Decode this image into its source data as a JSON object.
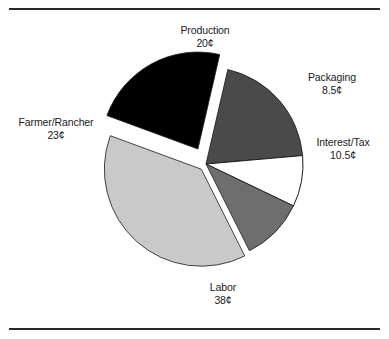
{
  "figure": {
    "top_rule": "horizontal-rule",
    "bottom_rule": "horizontal-rule"
  },
  "chart_data": {
    "type": "pie",
    "title": "",
    "subtitle": "",
    "xlabel": "",
    "ylabel": "",
    "legend_position": "none",
    "grid": false,
    "unit": "¢",
    "total": 100,
    "start_angle_deg": -77,
    "direction": "clockwise",
    "center": {
      "x": 206,
      "y": 164
    },
    "radius": 97,
    "slices": [
      {
        "label": "Production",
        "value": 20,
        "value_text": "20¢",
        "color": "#4a4a4a",
        "stroke": "#1a1a1a",
        "exploded": false,
        "explode_offset": 0
      },
      {
        "label": "Packaging",
        "value": 8.5,
        "value_text": "8.5¢",
        "color": "#ffffff",
        "stroke": "#1a1a1a",
        "exploded": false,
        "explode_offset": 0
      },
      {
        "label": "Interest/Tax",
        "value": 10.5,
        "value_text": "10.5¢",
        "color": "#6e6e6e",
        "stroke": "#1a1a1a",
        "exploded": false,
        "explode_offset": 0
      },
      {
        "label": "Labor",
        "value": 38,
        "value_text": "38¢",
        "color": "#c9c9c9",
        "stroke": "#1a1a1a",
        "exploded": true,
        "explode_offset": 7
      },
      {
        "label": "Farmer/Rancher",
        "value": 23,
        "value_text": "23¢",
        "color": "#000000",
        "stroke": "#1a1a1a",
        "exploded": true,
        "explode_offset": 17
      }
    ]
  },
  "labels": {
    "production": {
      "name": "Production",
      "value": "20¢"
    },
    "packaging": {
      "name": "Packaging",
      "value": "8.5¢"
    },
    "interest_tax": {
      "name": "Interest/Tax",
      "value": "10.5¢"
    },
    "labor": {
      "name": "Labor",
      "value": "38¢"
    },
    "farmer_rancher": {
      "name": "Farmer/Rancher",
      "value": "23¢"
    }
  }
}
